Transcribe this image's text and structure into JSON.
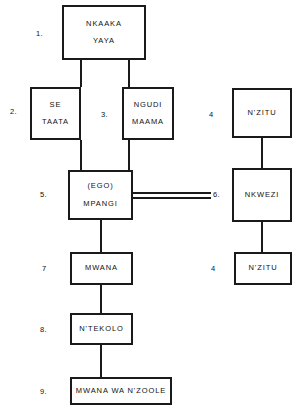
{
  "diagram": {
    "type": "kinship-genealogy-chart",
    "title": "",
    "nodes": [
      {
        "id": "n1",
        "number": "1.",
        "lines": [
          "NKAAKA",
          "YAYA"
        ]
      },
      {
        "id": "n2",
        "number": "2.",
        "lines": [
          "SE",
          "TAATA"
        ]
      },
      {
        "id": "n3",
        "number": "3.",
        "lines": [
          "NGUDI",
          "MAAMA"
        ]
      },
      {
        "id": "n4",
        "number": "4",
        "lines": [
          "N'ZITU"
        ]
      },
      {
        "id": "n5",
        "number": "5.",
        "lines": [
          "(EGO)",
          "MPANGI"
        ]
      },
      {
        "id": "n6",
        "number": "6.",
        "lines": [
          "NKWEZI"
        ]
      },
      {
        "id": "n7",
        "number": "7",
        "lines": [
          "MWANA"
        ]
      },
      {
        "id": "n8",
        "number": "8.",
        "lines": [
          "N'TEKOLO"
        ]
      },
      {
        "id": "n9",
        "number": "9.",
        "lines": [
          "MWANA WA N'ZOOLE"
        ]
      },
      {
        "id": "n10",
        "number": "4",
        "lines": [
          "N'ZITU"
        ]
      }
    ]
  },
  "colors": {
    "line": "#1a1a1a",
    "background": "#ffffff",
    "text": "#111111"
  }
}
